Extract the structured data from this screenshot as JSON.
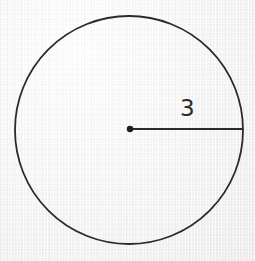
{
  "figure": {
    "kind": "geometry-diagram",
    "background_color": "#f7f7f7",
    "ink_color": "#2b2b2b"
  },
  "chart_data": {
    "type": "diagram",
    "title": "",
    "subtitle": "",
    "xlabel": "",
    "ylabel": "",
    "shapes": [
      {
        "name": "circle",
        "type": "circle",
        "center": [
          129,
          130
        ],
        "radius": 114,
        "stroke": "#2b2b2b",
        "stroke_width": 1.8,
        "fill": "none"
      },
      {
        "name": "center-point",
        "type": "point",
        "position": [
          130,
          129
        ],
        "radius": 3.2,
        "fill": "#1e1e1e"
      },
      {
        "name": "radius-segment",
        "type": "line",
        "from": [
          130,
          129
        ],
        "to": [
          243,
          129
        ],
        "stroke": "#2b2b2b",
        "stroke_width": 1.8
      }
    ],
    "annotations": [
      {
        "name": "radius-length-label",
        "text": "3",
        "position": [
          189,
          111
        ],
        "anchor": "middle",
        "font_size": 23,
        "color": "#2b2b2b",
        "describes": "radius-segment"
      }
    ],
    "legend": null,
    "grid": false,
    "axis_visible": false
  }
}
